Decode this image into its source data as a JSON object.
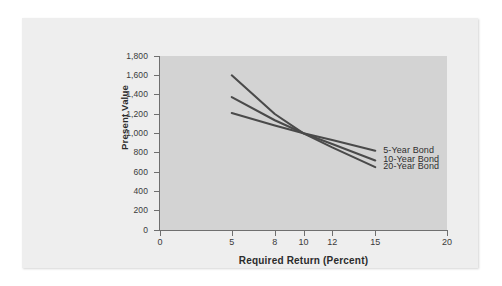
{
  "chart_data": {
    "type": "line",
    "title": "",
    "xlabel": "Required Return (Percent)",
    "ylabel": "Present Value",
    "xlim": [
      0,
      20
    ],
    "ylim": [
      0,
      1800
    ],
    "grid": false,
    "legend_position": "inline-right",
    "x_ticks": [
      0,
      5,
      8,
      10,
      12,
      15,
      20
    ],
    "x_tick_labels": [
      "0",
      "5",
      "8",
      "10",
      "12",
      "15",
      "20"
    ],
    "y_ticks": [
      0,
      200,
      400,
      600,
      800,
      1000,
      1200,
      1400,
      1600,
      1800
    ],
    "y_tick_labels": [
      "0",
      "200",
      "400",
      "600",
      "800",
      "1,000",
      "1,200",
      "1,400",
      "1,600",
      "1,800"
    ],
    "x": [
      5,
      8,
      10,
      12,
      15
    ],
    "series": [
      {
        "name": "5-Year Bond",
        "values": [
          1210,
          1080,
          1000,
          930,
          820
        ],
        "color": "#4a4a4a"
      },
      {
        "name": "10-Year Bond",
        "values": [
          1375,
          1135,
          1000,
          890,
          720
        ],
        "color": "#4a4a4a"
      },
      {
        "name": "20-Year Bond",
        "values": [
          1600,
          1200,
          1000,
          855,
          650
        ],
        "color": "#4a4a4a"
      }
    ],
    "annotations": [
      {
        "text": "5-Year Bond",
        "x": 15,
        "y": 820
      },
      {
        "text": "10-Year Bond",
        "x": 15,
        "y": 720
      },
      {
        "text": "20-Year Bond",
        "x": 15,
        "y": 650
      }
    ]
  },
  "colors": {
    "card_background": "#eeeeee",
    "plot_background": "#d3d3d3",
    "axis": "#6f6f6f",
    "line": "#4a4a4a",
    "text": "#2b2b2b"
  }
}
